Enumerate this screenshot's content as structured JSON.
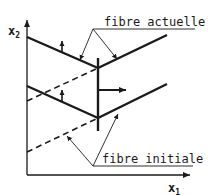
{
  "diagram": {
    "labels": {
      "current_fiber": "fibre actuelle",
      "initial_fiber": "fibre initiale"
    },
    "axes": {
      "y_axis": "x",
      "y_axis_sub": "2",
      "x_axis": "x",
      "x_axis_sub": "1"
    },
    "colors": {
      "ink": "#1a1a1a",
      "background": "#ffffff"
    }
  }
}
